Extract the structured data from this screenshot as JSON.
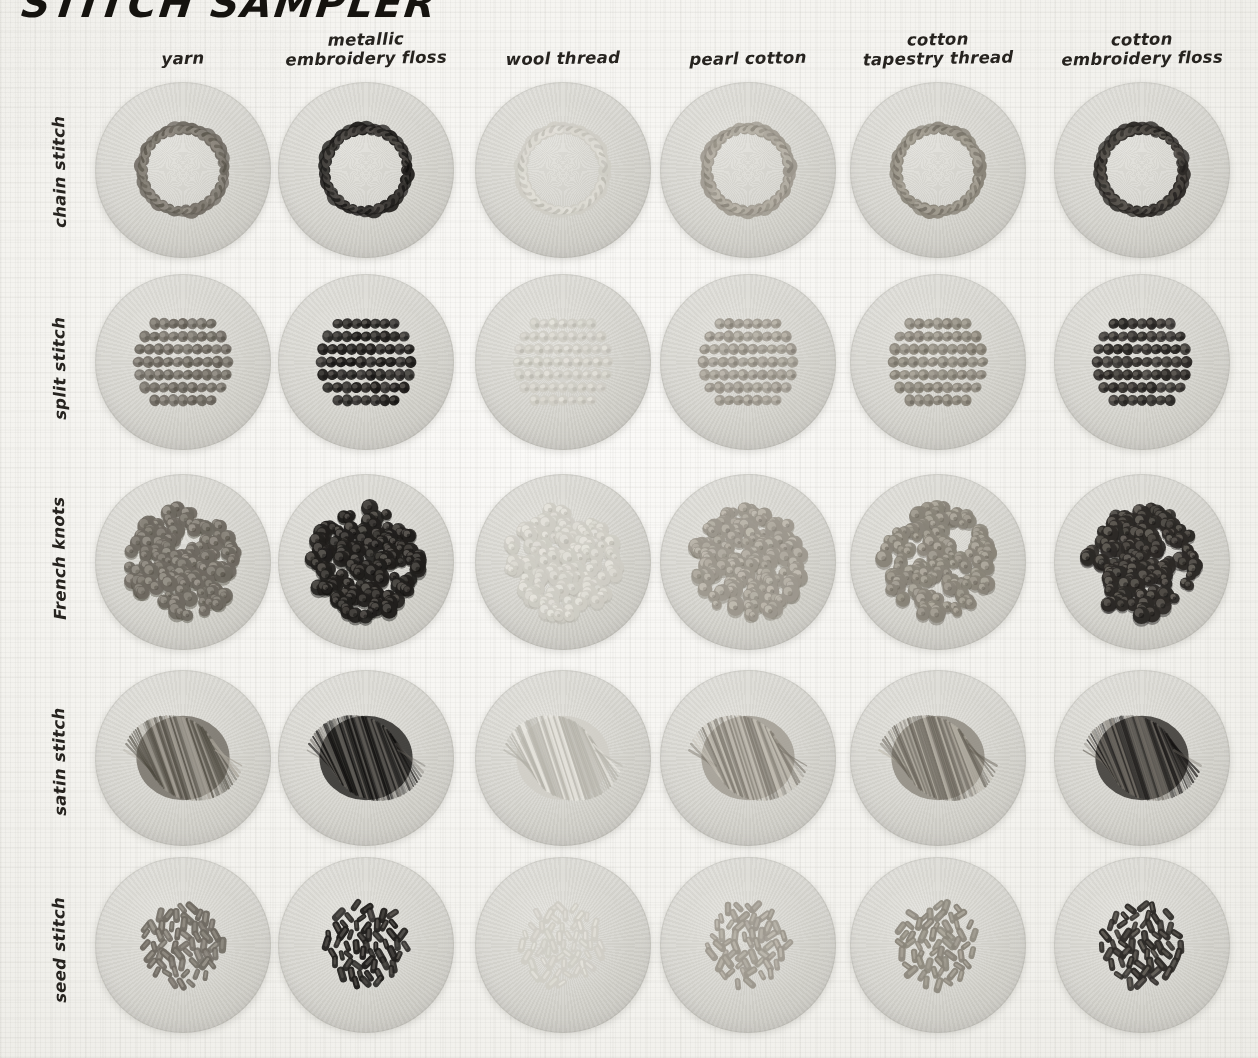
{
  "title": "STITCH SAMPLER",
  "columns": [
    {
      "id": "yarn",
      "label": "yarn",
      "tone": "#6f6a62",
      "tone_light": "#a8a399",
      "tone_dark": "#4d493f",
      "value": 0.62
    },
    {
      "id": "metallic-embroidery-floss",
      "label": "metallic\nembroidery floss",
      "tone": "#211f1d",
      "tone_light": "#6a6660",
      "tone_dark": "#0c0b0a",
      "value": 0.93
    },
    {
      "id": "wool-thread",
      "label": "wool thread",
      "tone": "#cfcdc5",
      "tone_light": "#eceae3",
      "tone_dark": "#b2b0a7",
      "value": 0.18
    },
    {
      "id": "pearl-cotton",
      "label": "pearl cotton",
      "tone": "#9d988e",
      "tone_light": "#cac5ba",
      "tone_dark": "#7b766c",
      "value": 0.4
    },
    {
      "id": "cotton-tapestry-thread",
      "label": "cotton\ntapestry thread",
      "tone": "#8a857a",
      "tone_light": "#b9b4a8",
      "tone_dark": "#645f55",
      "value": 0.5
    },
    {
      "id": "cotton-embroidery-floss",
      "label": "cotton\nembroidery floss",
      "tone": "#2d2a27",
      "tone_light": "#767169",
      "tone_dark": "#151312",
      "value": 0.88
    }
  ],
  "rows": [
    {
      "id": "chain-stitch",
      "label": "chain stitch",
      "motif": "ring"
    },
    {
      "id": "split-stitch",
      "label": "split stitch",
      "motif": "fill-rope"
    },
    {
      "id": "french-knots",
      "label": "French knots",
      "motif": "knots"
    },
    {
      "id": "satin-stitch",
      "label": "satin stitch",
      "motif": "satin"
    },
    {
      "id": "seed-stitch",
      "label": "seed stitch",
      "motif": "seeds"
    }
  ],
  "grid": {
    "col_centers": [
      183,
      366,
      563,
      748,
      938,
      1142
    ],
    "row_centers": [
      170,
      362,
      562,
      758,
      945
    ],
    "disc_diameter": 176,
    "col_head_y": 30,
    "row_head_x": 52
  },
  "chart_data": {
    "type": "table",
    "title": "STITCH SAMPLER",
    "xlabel": "thread type",
    "ylabel": "stitch type",
    "categories": [
      "yarn",
      "metallic embroidery floss",
      "wool thread",
      "pearl cotton",
      "cotton tapestry thread",
      "cotton embroidery floss"
    ],
    "rows": [
      "chain stitch",
      "split stitch",
      "French knots",
      "satin stitch",
      "seed stitch"
    ],
    "series": [
      {
        "name": "chain stitch",
        "values": [
          0.62,
          0.93,
          0.18,
          0.4,
          0.5,
          0.88
        ]
      },
      {
        "name": "split stitch",
        "values": [
          0.62,
          0.93,
          0.18,
          0.4,
          0.5,
          0.88
        ]
      },
      {
        "name": "French knots",
        "values": [
          0.62,
          0.93,
          0.18,
          0.4,
          0.5,
          0.88
        ]
      },
      {
        "name": "satin stitch",
        "values": [
          0.62,
          0.93,
          0.18,
          0.4,
          0.5,
          0.88
        ]
      },
      {
        "name": "seed stitch",
        "values": [
          0.62,
          0.93,
          0.18,
          0.4,
          0.5,
          0.88
        ]
      }
    ],
    "legend": "tone value = relative darkness of worked thread on grey felt disc",
    "grid": false
  }
}
